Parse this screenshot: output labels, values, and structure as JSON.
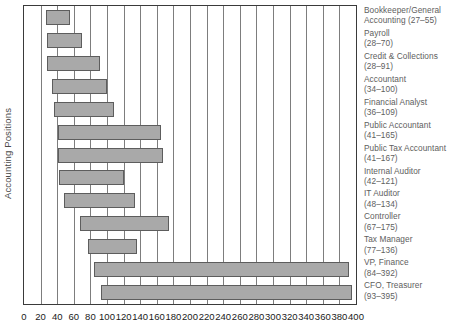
{
  "chart_data": {
    "type": "bar",
    "orientation": "horizontal",
    "subtype": "range-bar",
    "title": "",
    "xlabel": "",
    "ylabel": "Accounting Positions",
    "xlim": [
      0,
      400
    ],
    "xticks": [
      0,
      20,
      40,
      60,
      80,
      100,
      120,
      140,
      160,
      180,
      200,
      220,
      240,
      260,
      280,
      300,
      320,
      340,
      360,
      380,
      400
    ],
    "grid": true,
    "legend": "none",
    "bar_color": "#a9a9a9",
    "bar_border_color": "#5d5d5d",
    "categories": [
      "Bookkeeper/General Accounting",
      "Payroll",
      "Credit & Collections",
      "Accountant",
      "Financial Analyst",
      "Public Accountant",
      "Public Tax Accountant",
      "Internal Auditor",
      "IT Auditor",
      "Controller",
      "Tax Manager",
      "VP, Finance",
      "CFO, Treasurer"
    ],
    "labels": [
      "Bookkeeper/General Accounting (27–55)",
      "Payroll (28–70)",
      "Credit & Collections (28–91)",
      "Accountant (34–100)",
      "Financial Analyst (36–109)",
      "Public Accountant (41–165)",
      "Public Tax Accountant (41–167)",
      "Internal Auditor (42–121)",
      "IT Auditor (48–134)",
      "Controller (67–175)",
      "Tax Manager (77–136)",
      "VP, Finance (84–392)",
      "CFO, Treasurer (93–395)"
    ],
    "label_lines": [
      [
        "Bookkeeper/General",
        "Accounting (27–55)"
      ],
      [
        "Payroll",
        "(28–70)"
      ],
      [
        "Credit & Collections",
        "(28–91)"
      ],
      [
        "Accountant",
        "(34–100)"
      ],
      [
        "Financial Analyst",
        "(36–109)"
      ],
      [
        "Public Accountant",
        "(41–165)"
      ],
      [
        "Public Tax Accountant",
        "(41–167)"
      ],
      [
        "Internal Auditor",
        "(42–121)"
      ],
      [
        "IT Auditor",
        "(48–134)"
      ],
      [
        "Controller",
        "(67–175)"
      ],
      [
        "Tax Manager",
        "(77–136)"
      ],
      [
        "VP, Finance",
        "(84–392)"
      ],
      [
        "CFO, Treasurer",
        "(93–395)"
      ]
    ],
    "low": [
      27,
      28,
      28,
      34,
      36,
      41,
      41,
      42,
      48,
      67,
      77,
      84,
      93
    ],
    "high": [
      55,
      70,
      91,
      100,
      109,
      165,
      167,
      121,
      134,
      175,
      136,
      392,
      395
    ]
  }
}
